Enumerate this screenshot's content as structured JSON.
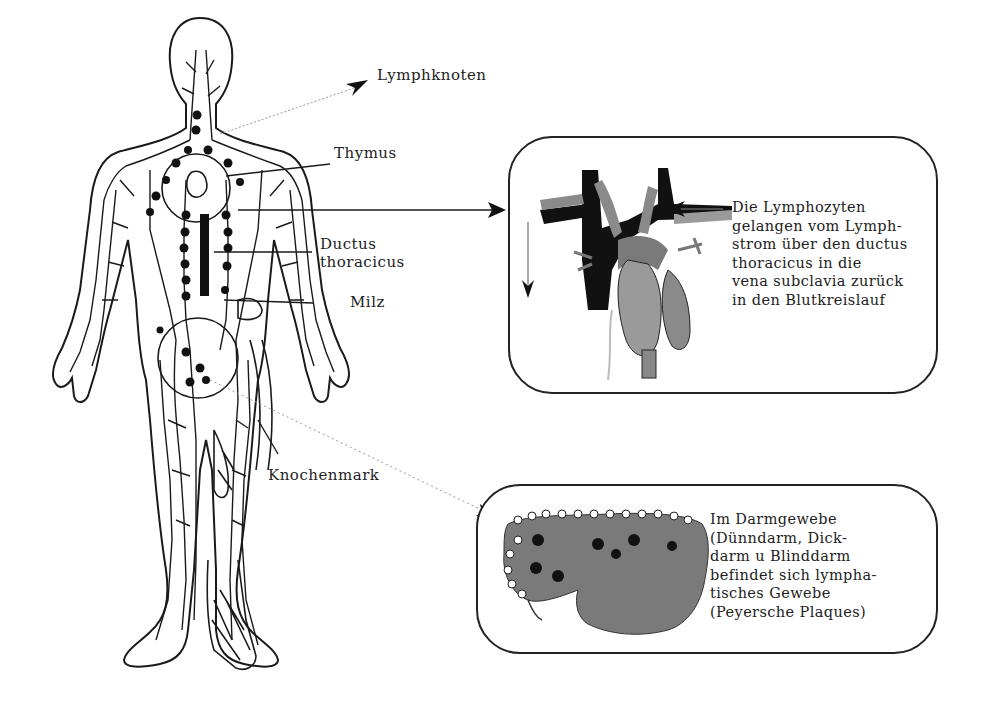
{
  "diagram": {
    "type": "anatomical-illustration",
    "labels": {
      "lymphknoten": "Lymphknoten",
      "thymus": "Thymus",
      "ductus_line1": "Ductus",
      "ductus_line2": "thoracicus",
      "milz": "Milz",
      "knochenmark": "Knochenmark"
    },
    "heart_box": {
      "lines": [
        "Die Lymphozyten",
        "gelangen vom Lymph-",
        "strom über den ductus",
        "thoracicus in die",
        "vena subclavia zurück",
        "in den Blutkreislauf"
      ]
    },
    "intestine_box": {
      "lines": [
        "Im Darmgewebe",
        "(Dünndarm, Dick-",
        "darm u Blinddarm",
        "befindet sich lympha-",
        "tisches Gewebe",
        "(Peyersche Plaques)"
      ]
    },
    "colors": {
      "ink": "#1a1a1a",
      "vessel_dark": "#111111",
      "vessel_gray": "#8a8a8a",
      "organ_gray": "#7a7a7a",
      "background": "#ffffff"
    }
  }
}
